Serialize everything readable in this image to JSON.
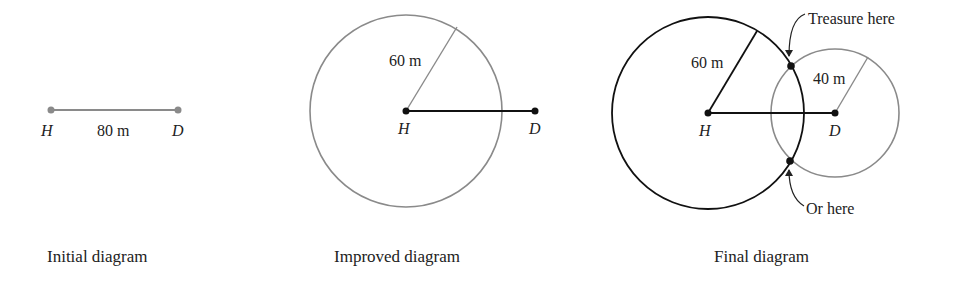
{
  "diagrams": [
    {
      "id": "initial",
      "caption": "Initial diagram",
      "points": {
        "h": "H",
        "d": "D"
      },
      "distance_label": "80 m",
      "colors": {
        "line": "#8a8a8a",
        "point": "#8a8a8a"
      }
    },
    {
      "id": "improved",
      "caption": "Improved diagram",
      "points": {
        "h": "H",
        "d": "D"
      },
      "radius_label": "60 m",
      "colors": {
        "circle": "#8a8a8a",
        "line": "#111111",
        "point": "#111111"
      }
    },
    {
      "id": "final",
      "caption": "Final diagram",
      "points": {
        "h": "H",
        "d": "D"
      },
      "radius_label_h": "60 m",
      "radius_label_d": "40 m",
      "annotations": {
        "top": "Treasure here",
        "bottom": "Or here"
      },
      "colors": {
        "circle_h": "#111111",
        "circle_d": "#8a8a8a",
        "line": "#111111",
        "point": "#111111"
      }
    }
  ],
  "measurements": {
    "hd_distance_m": 80,
    "radius_h_m": 60,
    "radius_d_m": 40
  }
}
